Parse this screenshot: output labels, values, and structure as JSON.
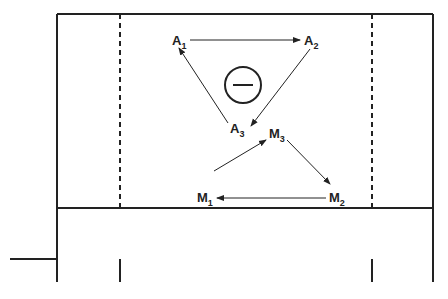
{
  "diagram": {
    "sign_symbol": "−",
    "nodes": {
      "A1": {
        "base": "A",
        "sub": "1"
      },
      "A2": {
        "base": "A",
        "sub": "2"
      },
      "A3": {
        "base": "A",
        "sub": "3"
      },
      "M1": {
        "base": "M",
        "sub": "1"
      },
      "M2": {
        "base": "M",
        "sub": "2"
      },
      "M3": {
        "base": "M",
        "sub": "3"
      }
    },
    "edges": [
      {
        "from": "A1",
        "to": "A2"
      },
      {
        "from": "A2",
        "to": "A3"
      },
      {
        "from": "A3",
        "to": "A1"
      },
      {
        "from": "M1",
        "to": "M3"
      },
      {
        "from": "M3",
        "to": "M2"
      },
      {
        "from": "M2",
        "to": "M1"
      }
    ],
    "colors": {
      "line": "#222222",
      "background": "#ffffff"
    }
  }
}
